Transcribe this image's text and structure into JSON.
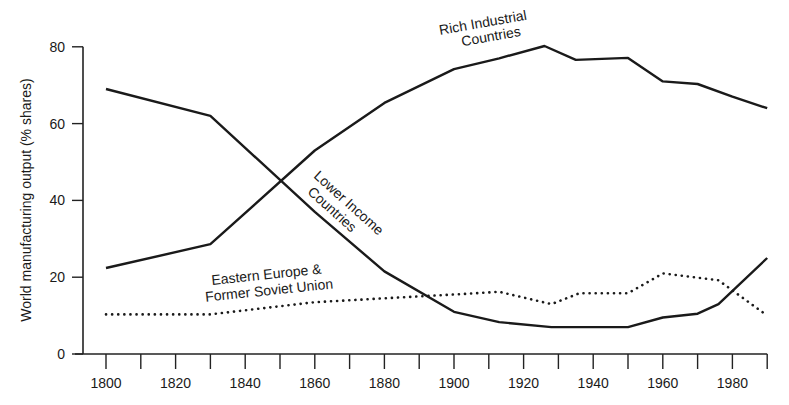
{
  "chart_data": {
    "type": "line",
    "title": "",
    "xlabel": "",
    "ylabel": "World manufacturing output (% shares)",
    "xlim": [
      1790,
      1990
    ],
    "ylim": [
      0,
      80
    ],
    "x_ticks": [
      1800,
      1810,
      1820,
      1830,
      1840,
      1850,
      1860,
      1870,
      1880,
      1890,
      1900,
      1910,
      1920,
      1930,
      1940,
      1950,
      1960,
      1970,
      1980,
      1990
    ],
    "x_tick_labels": [
      "1800",
      "1820",
      "1840",
      "1860",
      "1880",
      "1900",
      "1920",
      "1940",
      "1960",
      "1980"
    ],
    "y_ticks": [
      0,
      20,
      40,
      60,
      80
    ],
    "y_tick_labels": [
      "0",
      "20",
      "40",
      "60",
      "80"
    ],
    "grid": false,
    "legend": "inline annotations",
    "series": [
      {
        "name": "Rich Industrial Countries",
        "label_lines": [
          "Rich Industrial",
          "Countries"
        ],
        "style": "solid",
        "x": [
          1800,
          1830,
          1860,
          1880,
          1900,
          1913,
          1926,
          1935,
          1950,
          1960,
          1970,
          1980,
          1990
        ],
        "values": [
          22.4,
          28.6,
          53,
          65.4,
          74.2,
          77,
          80.2,
          76.6,
          77.1,
          71,
          70.3,
          67,
          64
        ]
      },
      {
        "name": "Lower Income Countries",
        "label_lines": [
          "Lower Income",
          "Countries"
        ],
        "style": "solid",
        "x": [
          1800,
          1830,
          1860,
          1880,
          1900,
          1913,
          1928,
          1950,
          1960,
          1970,
          1976,
          1990
        ],
        "values": [
          69,
          62,
          37,
          21.5,
          11,
          8.3,
          7,
          7,
          9.5,
          10.5,
          13,
          25
        ]
      },
      {
        "name": "Eastern Europe & Former Soviet Union",
        "label_lines": [
          "Eastern Europe &",
          "Former Soviet Union"
        ],
        "style": "dotted",
        "x": [
          1800,
          1830,
          1860,
          1880,
          1900,
          1913,
          1928,
          1936,
          1950,
          1960,
          1976,
          1990
        ],
        "values": [
          10.3,
          10.3,
          13.5,
          14.5,
          15.5,
          16.2,
          13,
          15.8,
          15.8,
          21,
          19.2,
          10
        ]
      }
    ]
  }
}
